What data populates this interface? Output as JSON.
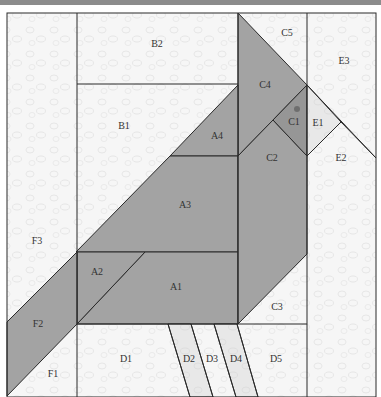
{
  "diagram": {
    "colors": {
      "background_fabric": "#f6f6f6",
      "dark_fabric": "#a3a3a3",
      "medium_fabric": "#bfbfbf",
      "light_fabric": "#e6e6e6",
      "line": "#2a2a2a",
      "topbar": "#8c8c8c",
      "eye": "#6e6e6e"
    },
    "pieces": [
      {
        "id": "B2",
        "label": "B2",
        "x": 157,
        "y": 45
      },
      {
        "id": "B1",
        "label": "B1",
        "x": 124,
        "y": 127
      },
      {
        "id": "A4",
        "label": "A4",
        "x": 217,
        "y": 137
      },
      {
        "id": "A3",
        "label": "A3",
        "x": 185,
        "y": 206
      },
      {
        "id": "A2",
        "label": "A2",
        "x": 97,
        "y": 273
      },
      {
        "id": "A1",
        "label": "A1",
        "x": 176,
        "y": 288
      },
      {
        "id": "C5",
        "label": "C5",
        "x": 287,
        "y": 34
      },
      {
        "id": "C4",
        "label": "C4",
        "x": 265,
        "y": 86
      },
      {
        "id": "C1",
        "label": "C1",
        "x": 294,
        "y": 123
      },
      {
        "id": "C2",
        "label": "C2",
        "x": 272,
        "y": 159
      },
      {
        "id": "C3",
        "label": "C3",
        "x": 277,
        "y": 308
      },
      {
        "id": "E3",
        "label": "E3",
        "x": 344,
        "y": 62
      },
      {
        "id": "E1",
        "label": "E1",
        "x": 318,
        "y": 124
      },
      {
        "id": "E2",
        "label": "E2",
        "x": 341,
        "y": 159
      },
      {
        "id": "F3",
        "label": "F3",
        "x": 37,
        "y": 242
      },
      {
        "id": "F2",
        "label": "F2",
        "x": 38,
        "y": 325
      },
      {
        "id": "F1",
        "label": "F1",
        "x": 53,
        "y": 375
      },
      {
        "id": "D1",
        "label": "D1",
        "x": 126,
        "y": 360
      },
      {
        "id": "D2",
        "label": "D2",
        "x": 189,
        "y": 360
      },
      {
        "id": "D3",
        "label": "D3",
        "x": 212,
        "y": 360
      },
      {
        "id": "D4",
        "label": "D4",
        "x": 236,
        "y": 360
      },
      {
        "id": "D5",
        "label": "D5",
        "x": 276,
        "y": 360
      }
    ]
  }
}
